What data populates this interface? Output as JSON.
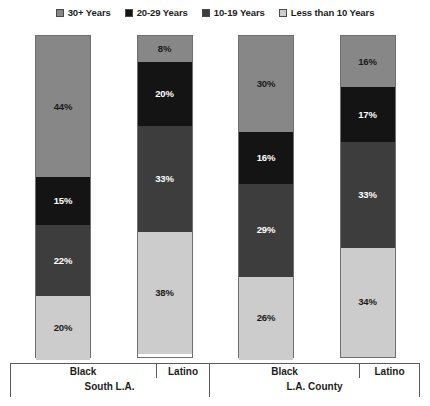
{
  "chart_data": {
    "type": "bar",
    "title": "",
    "subtitle": "",
    "xlabel": "",
    "ylabel": "",
    "ylim": [
      0,
      100
    ],
    "grid": false,
    "stacked": true,
    "stack_order": "bottom-to-top",
    "legend_position": "top-center",
    "value_suffix": "%",
    "categories": [
      "Black",
      "Latino",
      "Black",
      "Latino"
    ],
    "groups": [
      {
        "label": "South L.A.",
        "categories": [
          "Black",
          "Latino"
        ]
      },
      {
        "label": "L.A. County",
        "categories": [
          "Black",
          "Latino"
        ]
      }
    ],
    "series": [
      {
        "name": "Less than 10 Years",
        "color": "#cccccc",
        "values": [
          20,
          38,
          26,
          34
        ]
      },
      {
        "name": "10-19 Years",
        "color": "#3d3d3d",
        "values": [
          22,
          33,
          29,
          33
        ]
      },
      {
        "name": "20-29 Years",
        "color": "#141414",
        "values": [
          15,
          20,
          16,
          17
        ]
      },
      {
        "name": "30+ Years",
        "color": "#878787",
        "values": [
          44,
          8,
          30,
          16
        ]
      }
    ],
    "legend_entries": [
      {
        "label": "30+ Years",
        "color": "#878787"
      },
      {
        "label": "20-29 Years",
        "color": "#141414"
      },
      {
        "label": "10-19 Years",
        "color": "#3d3d3d"
      },
      {
        "label": "Less than 10 Years",
        "color": "#cccccc"
      }
    ],
    "bars": [
      {
        "category": "Black",
        "group": "South L.A.",
        "segments": [
          {
            "series": "30+ Years",
            "value": "44%",
            "color": "#878787",
            "pct": 44,
            "text_color": "#1a1a1a"
          },
          {
            "series": "20-29 Years",
            "value": "15%",
            "color": "#141414",
            "pct": 15,
            "text_color": "#ffffff"
          },
          {
            "series": "10-19 Years",
            "value": "22%",
            "color": "#3d3d3d",
            "pct": 22,
            "text_color": "#ffffff"
          },
          {
            "series": "Less than 10 Years",
            "value": "20%",
            "color": "#cccccc",
            "pct": 20,
            "text_color": "#1a1a1a"
          }
        ]
      },
      {
        "category": "Latino",
        "group": "South L.A.",
        "segments": [
          {
            "series": "30+ Years",
            "value": "8%",
            "color": "#878787",
            "pct": 8,
            "text_color": "#1a1a1a"
          },
          {
            "series": "20-29 Years",
            "value": "20%",
            "color": "#141414",
            "pct": 20,
            "text_color": "#ffffff"
          },
          {
            "series": "10-19 Years",
            "value": "33%",
            "color": "#3d3d3d",
            "pct": 33,
            "text_color": "#ffffff"
          },
          {
            "series": "Less than 10 Years",
            "value": "38%",
            "color": "#cccccc",
            "pct": 38,
            "text_color": "#1a1a1a"
          }
        ]
      },
      {
        "category": "Black",
        "group": "L.A. County",
        "segments": [
          {
            "series": "30+ Years",
            "value": "30%",
            "color": "#878787",
            "pct": 30,
            "text_color": "#1a1a1a"
          },
          {
            "series": "20-29 Years",
            "value": "16%",
            "color": "#141414",
            "pct": 16,
            "text_color": "#ffffff"
          },
          {
            "series": "10-19 Years",
            "value": "29%",
            "color": "#3d3d3d",
            "pct": 29,
            "text_color": "#ffffff"
          },
          {
            "series": "Less than 10 Years",
            "value": "26%",
            "color": "#cccccc",
            "pct": 26,
            "text_color": "#1a1a1a"
          }
        ]
      },
      {
        "category": "Latino",
        "group": "L.A. County",
        "segments": [
          {
            "series": "30+ Years",
            "value": "16%",
            "color": "#878787",
            "pct": 16,
            "text_color": "#1a1a1a"
          },
          {
            "series": "20-29 Years",
            "value": "17%",
            "color": "#141414",
            "pct": 17,
            "text_color": "#ffffff"
          },
          {
            "series": "10-19 Years",
            "value": "33%",
            "color": "#3d3d3d",
            "pct": 33,
            "text_color": "#ffffff"
          },
          {
            "series": "Less than 10 Years",
            "value": "34%",
            "color": "#cccccc",
            "pct": 34,
            "text_color": "#1a1a1a"
          }
        ]
      }
    ]
  },
  "footnote": ""
}
